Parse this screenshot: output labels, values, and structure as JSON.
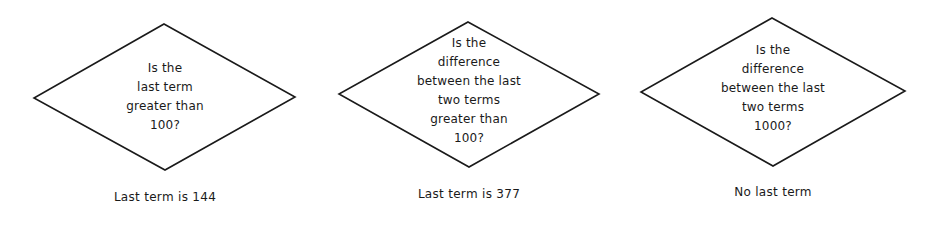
{
  "diagram": {
    "stroke_color": "#1a1a1a",
    "background": "#ffffff",
    "decisions": [
      {
        "lines": [
          "Is the",
          "last term",
          "greater than",
          "100?"
        ],
        "caption": "Last term is 144"
      },
      {
        "lines": [
          "Is the",
          "difference",
          "between the last",
          "two terms",
          "greater than",
          "100?"
        ],
        "caption": "Last term is 377"
      },
      {
        "lines": [
          "Is the",
          "difference",
          "between the last",
          "two terms",
          "1000?"
        ],
        "caption": "No last term"
      }
    ]
  }
}
